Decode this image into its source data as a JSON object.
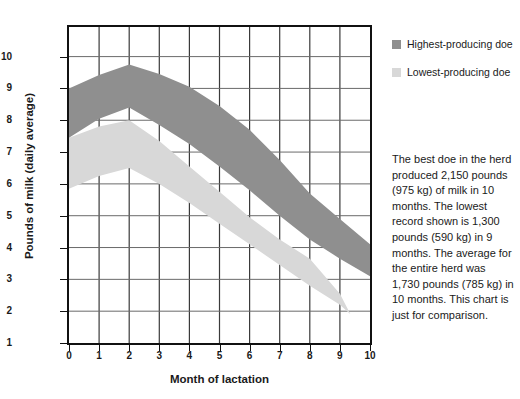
{
  "chart_data": {
    "type": "area",
    "title": "",
    "xlabel": "Month of lactation",
    "ylabel": "Pounds of milk (daily average)",
    "xlim": [
      0,
      10
    ],
    "ylim": [
      1,
      10.93
    ],
    "xticks": [
      0,
      1,
      2,
      3,
      4,
      5,
      6,
      7,
      8,
      9,
      10
    ],
    "yticks": [
      1,
      2,
      3,
      4,
      5,
      6,
      7,
      8,
      9,
      10
    ],
    "grid": true,
    "legend_position": "right-top",
    "series": [
      {
        "name": "Highest-producing doe",
        "color": "#8f8f8f",
        "kind": "band",
        "x": [
          0,
          1,
          2,
          3,
          4,
          5,
          6,
          7,
          8,
          9,
          10
        ],
        "upper": [
          9.0,
          9.42,
          9.75,
          9.45,
          9.05,
          8.45,
          7.7,
          6.75,
          5.7,
          4.9,
          4.1
        ],
        "lower": [
          7.45,
          8.05,
          8.4,
          7.85,
          7.25,
          6.55,
          5.8,
          5.0,
          4.25,
          3.65,
          3.1
        ]
      },
      {
        "name": "Lowest-producing doe",
        "color": "#d8d8d8",
        "kind": "band",
        "x": [
          0,
          1,
          2,
          3,
          4,
          5,
          6,
          7,
          8,
          9,
          9.35
        ],
        "upper": [
          7.45,
          7.8,
          8.0,
          7.35,
          6.55,
          5.75,
          4.95,
          4.25,
          3.65,
          2.55,
          1.9
        ],
        "lower": [
          5.85,
          6.25,
          6.5,
          6.0,
          5.4,
          4.75,
          4.1,
          3.45,
          2.8,
          2.2,
          1.9
        ]
      }
    ]
  },
  "legend": {
    "items": [
      {
        "label": "Highest-producing doe",
        "color": "#8f8f8f"
      },
      {
        "label": "Lowest-producing doe",
        "color": "#d8d8d8"
      }
    ]
  },
  "note": {
    "text": "The best doe in the herd produced 2,150 pounds (975 kg) of milk in 10 months. The lowest record shown is 1,300 pounds (590 kg) in 9 months. The average for the entire herd was 1,730 pounds (785 kg) in 10 months. This chart is just for comparison."
  },
  "axis": {
    "x_title": "Month of lactation",
    "y_title": "Pounds of milk (daily average)",
    "x_tick_labels": [
      "0",
      "1",
      "2",
      "3",
      "4",
      "5",
      "6",
      "7",
      "8",
      "9",
      "10"
    ],
    "y_tick_labels": [
      "1",
      "2",
      "3",
      "4",
      "5",
      "6",
      "7",
      "8",
      "9",
      "10"
    ]
  }
}
